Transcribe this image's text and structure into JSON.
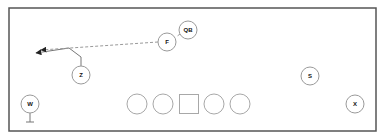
{
  "diagram": {
    "title": "",
    "field": {
      "x": 9,
      "y": 8,
      "width": 367,
      "height": 123,
      "border_color": "#555555"
    },
    "colors": {
      "line": "#777777",
      "dashed": "#9a9a9a",
      "node_stroke": "#9a9a9a",
      "label": "#111111"
    },
    "players": [
      {
        "id": "qb",
        "label": "QB",
        "cx": 188,
        "cy": 30,
        "r": 9
      },
      {
        "id": "f",
        "label": "F",
        "cx": 167,
        "cy": 42,
        "r": 9
      },
      {
        "id": "z",
        "label": "Z",
        "cx": 81,
        "cy": 75,
        "r": 9
      },
      {
        "id": "w",
        "label": "W",
        "cx": 30,
        "cy": 104,
        "r": 9
      },
      {
        "id": "s",
        "label": "S",
        "cx": 310,
        "cy": 76,
        "r": 9
      },
      {
        "id": "x",
        "label": "X",
        "cx": 355,
        "cy": 104,
        "r": 9
      }
    ],
    "offensive_line": [
      {
        "id": "lt",
        "shape": "circle",
        "cx": 137,
        "cy": 104,
        "r": 10
      },
      {
        "id": "lg",
        "shape": "circle",
        "cx": 163,
        "cy": 104,
        "r": 10
      },
      {
        "id": "c",
        "shape": "square",
        "cx": 189,
        "cy": 104,
        "size": 19
      },
      {
        "id": "rg",
        "shape": "circle",
        "cx": 214,
        "cy": 104,
        "r": 10
      },
      {
        "id": "rt",
        "shape": "circle",
        "cx": 240,
        "cy": 104,
        "r": 10
      }
    ],
    "routes": [
      {
        "id": "z-route",
        "from": "Z",
        "style": "solid",
        "points": "81,66 81,57 69,48 36,53",
        "arrow": true
      },
      {
        "id": "pass-line",
        "from": "QB",
        "via": "F",
        "style": "dashed",
        "points": "180,34 176,37",
        "arrow": false
      },
      {
        "id": "f-route",
        "from": "F",
        "style": "dashed",
        "points": "158,42 41,50",
        "arrow": true
      }
    ],
    "blocks": [
      {
        "id": "w-block",
        "from": "W",
        "stem": "30,113 30,122",
        "bar": "26,122 34,122"
      }
    ]
  }
}
